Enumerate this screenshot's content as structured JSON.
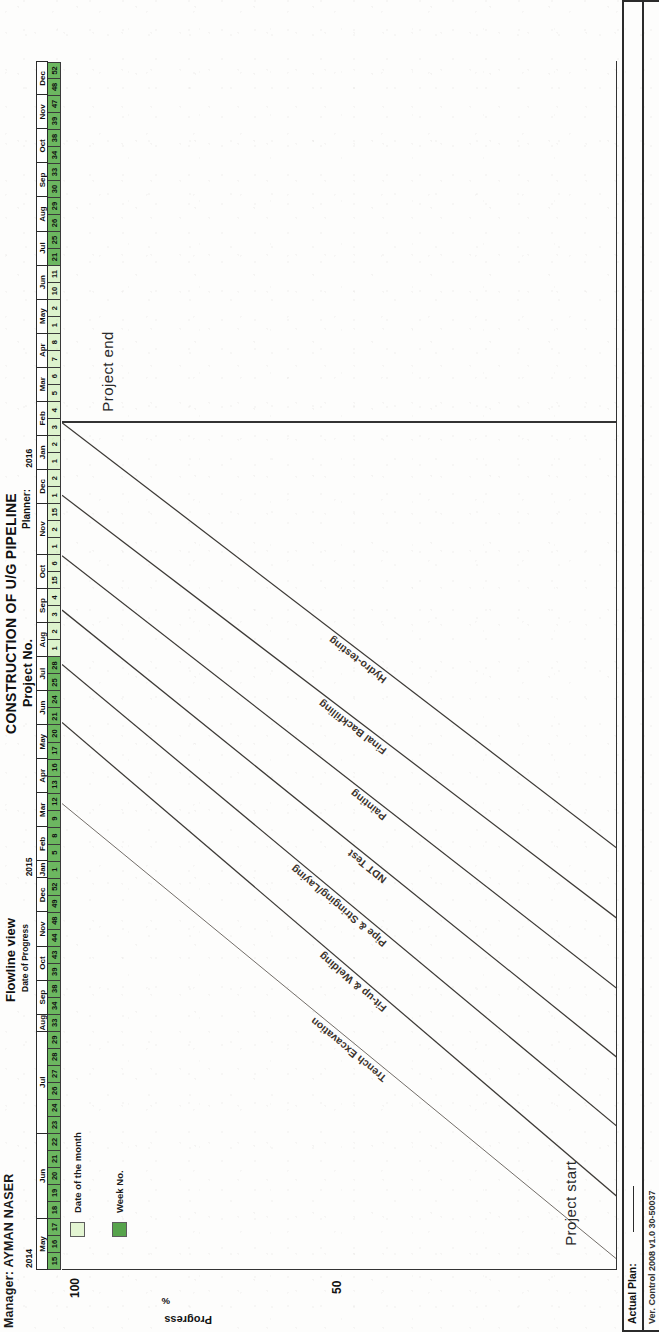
{
  "header": {
    "manager_label": "Manager: AYMAN NASER",
    "title_main": "CONSTRUCTION OF U/G PIPELINE",
    "title_project_no": "Project No.",
    "title_planner": "Planner:",
    "flowline_title": "Flowline view",
    "flowline_sub": "Date  of Progress"
  },
  "axis": {
    "y_title": "Progress",
    "y_unit": "%",
    "ticks": [
      "100",
      "50"
    ]
  },
  "legend": {
    "items": [
      {
        "label": "Date of the month",
        "color": "#e3f5d2",
        "swatch": "light"
      },
      {
        "label": "Week No.",
        "color": "#57a44c",
        "swatch": "dark"
      }
    ]
  },
  "milestones": {
    "start": "Project start",
    "end": "Project end"
  },
  "footer": {
    "actual_plan_label": "Actual Plan:",
    "note": "Ver. Control 2008 v1.0 30-50037"
  },
  "calendar": {
    "years": [
      {
        "year": "2014",
        "start_month_index": 0,
        "month_count": 8
      },
      {
        "year": "2015",
        "start_month_index": 8,
        "month_count": 12
      },
      {
        "year": "2016",
        "start_month_index": 20,
        "month_count": 6
      }
    ],
    "months": [
      {
        "name": "May",
        "year": "2014",
        "weeks": [
          {
            "v": "15",
            "t": "week"
          },
          {
            "v": "16",
            "t": "week"
          },
          {
            "v": "17",
            "t": "week"
          }
        ]
      },
      {
        "name": "Jun",
        "year": "2014",
        "weeks": [
          {
            "v": "18",
            "t": "week"
          },
          {
            "v": "19",
            "t": "week"
          },
          {
            "v": "20",
            "t": "week"
          },
          {
            "v": "21",
            "t": "week"
          },
          {
            "v": "22",
            "t": "week"
          }
        ]
      },
      {
        "name": "Jul",
        "year": "2014",
        "weeks": [
          {
            "v": "23",
            "t": "week"
          },
          {
            "v": "24",
            "t": "week"
          },
          {
            "v": "26",
            "t": "week"
          },
          {
            "v": "27",
            "t": "week"
          },
          {
            "v": "28",
            "t": "week"
          },
          {
            "v": "29",
            "t": "week"
          }
        ]
      },
      {
        "name": "Aug",
        "year": "2014",
        "weeks": [
          {
            "v": "33",
            "t": "week"
          }
        ]
      },
      {
        "name": "Sep",
        "year": "2014",
        "weeks": [
          {
            "v": "34",
            "t": "week"
          },
          {
            "v": "38",
            "t": "week"
          }
        ]
      },
      {
        "name": "Oct",
        "year": "2014",
        "weeks": [
          {
            "v": "39",
            "t": "week"
          },
          {
            "v": "43",
            "t": "week"
          }
        ]
      },
      {
        "name": "Nov",
        "year": "2014",
        "weeks": [
          {
            "v": "44",
            "t": "week"
          },
          {
            "v": "48",
            "t": "week"
          }
        ]
      },
      {
        "name": "Dec",
        "year": "2014",
        "weeks": [
          {
            "v": "49",
            "t": "week"
          },
          {
            "v": "52",
            "t": "week"
          }
        ]
      },
      {
        "name": "Jan",
        "year": "2015",
        "weeks": [
          {
            "v": "1",
            "t": "week"
          }
        ]
      },
      {
        "name": "Feb",
        "year": "2015",
        "weeks": [
          {
            "v": "5",
            "t": "week"
          },
          {
            "v": "8",
            "t": "week"
          }
        ]
      },
      {
        "name": "Mar",
        "year": "2015",
        "weeks": [
          {
            "v": "9",
            "t": "week"
          },
          {
            "v": "12",
            "t": "week"
          }
        ]
      },
      {
        "name": "Apr",
        "year": "2015",
        "weeks": [
          {
            "v": "13",
            "t": "week"
          },
          {
            "v": "16",
            "t": "week"
          }
        ]
      },
      {
        "name": "May",
        "year": "2015",
        "weeks": [
          {
            "v": "17",
            "t": "week"
          },
          {
            "v": "20",
            "t": "week"
          }
        ]
      },
      {
        "name": "Jun",
        "year": "2015",
        "weeks": [
          {
            "v": "21",
            "t": "week"
          },
          {
            "v": "24",
            "t": "week"
          }
        ]
      },
      {
        "name": "Jul",
        "year": "2015",
        "weeks": [
          {
            "v": "25",
            "t": "week"
          },
          {
            "v": "28",
            "t": "week"
          }
        ]
      },
      {
        "name": "Aug",
        "year": "2015",
        "weeks": [
          {
            "v": "1",
            "t": "date"
          },
          {
            "v": "2",
            "t": "date"
          }
        ]
      },
      {
        "name": "Sep",
        "year": "2015",
        "weeks": [
          {
            "v": "3",
            "t": "date"
          },
          {
            "v": "4",
            "t": "date"
          }
        ]
      },
      {
        "name": "Oct",
        "year": "2015",
        "weeks": [
          {
            "v": "15",
            "t": "date"
          },
          {
            "v": "6",
            "t": "date"
          }
        ]
      },
      {
        "name": "Nov",
        "year": "2015",
        "weeks": [
          {
            "v": "1",
            "t": "date"
          },
          {
            "v": "2",
            "t": "date"
          },
          {
            "v": "15",
            "t": "date"
          }
        ]
      },
      {
        "name": "Dec",
        "year": "2015",
        "weeks": [
          {
            "v": "1",
            "t": "date"
          },
          {
            "v": "2",
            "t": "date"
          }
        ]
      },
      {
        "name": "Jan",
        "year": "2016",
        "weeks": [
          {
            "v": "1",
            "t": "date"
          },
          {
            "v": "2",
            "t": "date"
          }
        ]
      },
      {
        "name": "Feb",
        "year": "2016",
        "weeks": [
          {
            "v": "3",
            "t": "date"
          },
          {
            "v": "4",
            "t": "date"
          }
        ]
      },
      {
        "name": "Mar",
        "year": "2016",
        "weeks": [
          {
            "v": "5",
            "t": "date"
          },
          {
            "v": "6",
            "t": "date"
          }
        ]
      },
      {
        "name": "Apr",
        "year": "2016",
        "weeks": [
          {
            "v": "7",
            "t": "date"
          },
          {
            "v": "8",
            "t": "date"
          }
        ]
      },
      {
        "name": "May",
        "year": "2016",
        "weeks": [
          {
            "v": "1",
            "t": "date"
          },
          {
            "v": "2",
            "t": "date"
          }
        ]
      },
      {
        "name": "Jun",
        "year": "2016",
        "weeks": [
          {
            "v": "10",
            "t": "date"
          },
          {
            "v": "11",
            "t": "date"
          }
        ]
      },
      {
        "name": "Jul",
        "year": "2016",
        "weeks": [
          {
            "v": "21",
            "t": "week"
          },
          {
            "v": "25",
            "t": "week"
          }
        ]
      },
      {
        "name": "Aug",
        "year": "2016",
        "weeks": [
          {
            "v": "26",
            "t": "week"
          },
          {
            "v": "29",
            "t": "week"
          }
        ]
      },
      {
        "name": "Sep",
        "year": "2016",
        "weeks": [
          {
            "v": "30",
            "t": "week"
          },
          {
            "v": "33",
            "t": "week"
          }
        ]
      },
      {
        "name": "Oct",
        "year": "2016",
        "weeks": [
          {
            "v": "34",
            "t": "week"
          },
          {
            "v": "38",
            "t": "week"
          }
        ]
      },
      {
        "name": "Nov",
        "year": "2016",
        "weeks": [
          {
            "v": "39",
            "t": "week"
          },
          {
            "v": "47",
            "t": "week"
          }
        ]
      },
      {
        "name": "Dec",
        "year": "2016",
        "weeks": [
          {
            "v": "48",
            "t": "week"
          },
          {
            "v": "52",
            "t": "week"
          }
        ]
      }
    ]
  },
  "chart_data": {
    "type": "line",
    "subtitle": "Date of Progress",
    "xlabel": "Date of Progress (months / week no.)",
    "ylabel": "Progress %",
    "ylim": [
      0,
      100
    ],
    "yticks": [
      50,
      100
    ],
    "grid": false,
    "legend_position": "top-left",
    "x_start": "May 2014 (wk 15)",
    "x_end": "Dec 2016 (wk 52)",
    "annotations": [
      {
        "text": "Project start",
        "x_frac": 0.02,
        "y_frac": 0.06
      },
      {
        "text": "Project end",
        "x_frac": 0.71,
        "y_frac": 0.94
      }
    ],
    "series": [
      {
        "name": "Trench Excavation",
        "style": "faint",
        "x0_frac": 0.008,
        "y0_frac": 0.0,
        "x1_frac": 0.385,
        "y1_frac": 1.0,
        "label_frac": 0.4
      },
      {
        "name": "Fit-up & Welding",
        "style": "solid",
        "x0_frac": 0.06,
        "y0_frac": 0.0,
        "x1_frac": 0.452,
        "y1_frac": 1.0,
        "label_frac": 0.4
      },
      {
        "name": "Pipe & Stringing/Laying",
        "style": "solid",
        "x0_frac": 0.118,
        "y0_frac": 0.0,
        "x1_frac": 0.5,
        "y1_frac": 1.0,
        "label_frac": 0.4
      },
      {
        "name": "NDT Test",
        "style": "solid",
        "x0_frac": 0.175,
        "y0_frac": 0.0,
        "x1_frac": 0.545,
        "y1_frac": 1.0,
        "label_frac": 0.4
      },
      {
        "name": "Painting",
        "style": "solid",
        "x0_frac": 0.232,
        "y0_frac": 0.0,
        "x1_frac": 0.59,
        "y1_frac": 1.0,
        "label_frac": 0.4
      },
      {
        "name": "Final Backfilling",
        "style": "solid",
        "x0_frac": 0.29,
        "y0_frac": 0.0,
        "x1_frac": 0.64,
        "y1_frac": 1.0,
        "label_frac": 0.4
      },
      {
        "name": "Hydro-testing",
        "style": "solid",
        "x0_frac": 0.348,
        "y0_frac": 0.0,
        "x1_frac": 0.7,
        "y1_frac": 1.0,
        "label_frac": 0.4
      }
    ]
  }
}
